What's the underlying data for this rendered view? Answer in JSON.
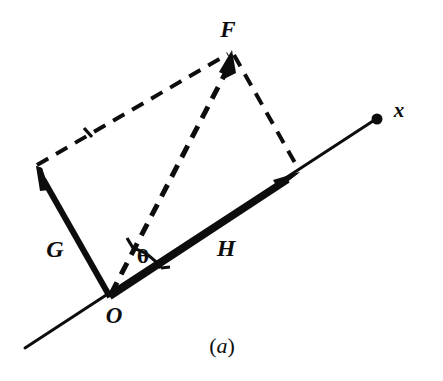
{
  "figure": {
    "caption": "(a)",
    "caption_paren_open": "(",
    "caption_letter": "a",
    "caption_paren_close": ")",
    "background_color": "#ffffff",
    "ink_color": "#0d0d0d",
    "width": 443,
    "height": 381
  },
  "labels": {
    "origin": "O",
    "resultant": "F",
    "vector_g": "G",
    "vector_h": "H",
    "axis": "x",
    "angle": "θ"
  },
  "geometry": {
    "origin_point": {
      "x": 110,
      "y": 297
    },
    "resultant_tip": {
      "x": 232,
      "y": 50
    },
    "vector_g_tip": {
      "x": 36,
      "y": 166
    },
    "vector_h_tip": {
      "x": 300,
      "y": 172
    },
    "axis_dot": {
      "x": 378,
      "y": 119
    },
    "axis_tail": {
      "x": 25,
      "y": 348
    },
    "angle_arc_radius": 52
  },
  "label_positions": {
    "origin": {
      "x": 114,
      "y": 315
    },
    "resultant": {
      "x": 228,
      "y": 29
    },
    "vector_g": {
      "x": 55,
      "y": 249
    },
    "vector_h": {
      "x": 226,
      "y": 248
    },
    "axis": {
      "x": 399,
      "y": 110
    },
    "angle": {
      "x": 143,
      "y": 257
    },
    "caption": {
      "x": 222,
      "y": 346
    }
  },
  "styles": {
    "solid_vector_width": 6,
    "dashed_line_width": 4,
    "axis_line_width": 3,
    "dash_pattern": "13 9",
    "arrowhead_length": 22,
    "arrowhead_half_width": 7
  }
}
